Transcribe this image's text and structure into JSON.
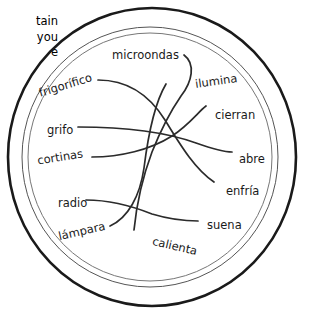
{
  "instructions": {
    "text": "tain\nyou\ne"
  },
  "diagram": {
    "type": "matching-exercise",
    "shape": "concentric-circles",
    "rings": [
      {
        "name": "outer-ring",
        "stroke": "#1a1a1a",
        "width": 2.6
      },
      {
        "name": "middle-ring",
        "stroke": "#555555",
        "width": 1.0
      },
      {
        "name": "inner-ring",
        "stroke": "#777777",
        "width": 1.0
      }
    ],
    "line_color": "#2b2b2b",
    "nouns": [
      {
        "id": "microondas",
        "label": "microondas",
        "x": 112,
        "y": 48,
        "rotate": 0
      },
      {
        "id": "frigorifico",
        "label": "frigorífico",
        "x": 38,
        "y": 78,
        "rotate": -17
      },
      {
        "id": "grifo",
        "label": "grifo",
        "x": 47,
        "y": 123,
        "rotate": 0
      },
      {
        "id": "cortinas",
        "label": "cortinas",
        "x": 37,
        "y": 150,
        "rotate": -9
      },
      {
        "id": "radio",
        "label": "radio",
        "x": 58,
        "y": 196,
        "rotate": 0
      },
      {
        "id": "lampara",
        "label": "lámpara",
        "x": 58,
        "y": 224,
        "rotate": -13
      }
    ],
    "verbs": [
      {
        "id": "ilumina",
        "label": "ilumina",
        "x": 195,
        "y": 74,
        "rotate": -8
      },
      {
        "id": "cierran",
        "label": "cierran",
        "x": 215,
        "y": 108,
        "rotate": 0
      },
      {
        "id": "abre",
        "label": "abre",
        "x": 239,
        "y": 152,
        "rotate": 0
      },
      {
        "id": "enfria",
        "label": "enfría",
        "x": 226,
        "y": 184,
        "rotate": 0
      },
      {
        "id": "suena",
        "label": "suena",
        "x": 207,
        "y": 218,
        "rotate": 0
      },
      {
        "id": "calienta",
        "label": "calienta",
        "x": 152,
        "y": 239,
        "rotate": 13
      }
    ],
    "connectors": [
      {
        "id": "connector-microondas",
        "path": "M 184 55 C 196 64 192 82 181 96 C 170 112 160 132 152 152 C 143 176 137 200 134 230"
      },
      {
        "id": "connector-frigorifico",
        "path": "M 98 80 C 128 80 150 96 165 120 C 182 148 196 170 214 182"
      },
      {
        "id": "connector-grifo",
        "path": "M 78 127 C 118 127 160 130 196 143 C 216 150 226 152 232 152"
      },
      {
        "id": "connector-cortinas",
        "path": "M 92 157 C 120 157 150 150 172 136 C 190 124 198 112 206 106"
      },
      {
        "id": "connector-radio",
        "path": "M 86 200 C 110 200 132 206 152 214 C 172 220 186 221 198 221"
      },
      {
        "id": "connector-lampara",
        "path": "M 110 226 C 128 218 140 196 144 168 C 148 136 154 104 166 84"
      }
    ]
  }
}
